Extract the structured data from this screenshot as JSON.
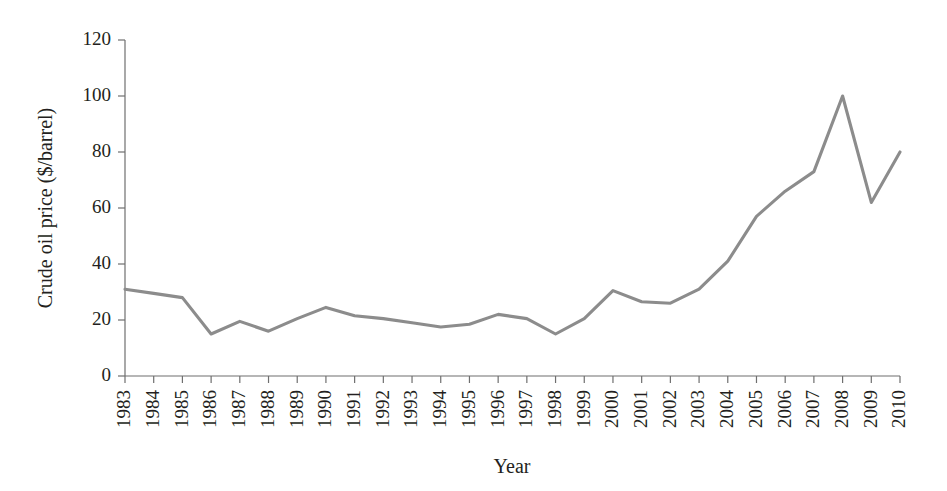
{
  "chart_data": {
    "type": "line",
    "title": "",
    "xlabel": "Year",
    "ylabel": "Crude oil price ($/barrel)",
    "categories": [
      "1983",
      "1984",
      "1985",
      "1986",
      "1987",
      "1988",
      "1989",
      "1990",
      "1991",
      "1992",
      "1993",
      "1994",
      "1995",
      "1996",
      "1997",
      "1998",
      "1999",
      "2000",
      "2001",
      "2002",
      "2003",
      "2004",
      "2005",
      "2006",
      "2007",
      "2008",
      "2009",
      "2010"
    ],
    "values": [
      31,
      29.5,
      28,
      15,
      19.5,
      16,
      20.5,
      24.5,
      21.5,
      20.5,
      19,
      17.5,
      18.5,
      22,
      20.5,
      15,
      20.5,
      30.5,
      26.5,
      26,
      31,
      41,
      57,
      66,
      73,
      100,
      62,
      80
    ],
    "series": [
      {
        "name": "Crude oil price",
        "color": "#8c8c8c",
        "values": [
          31,
          29.5,
          28,
          15,
          19.5,
          16,
          20.5,
          24.5,
          21.5,
          20.5,
          19,
          17.5,
          18.5,
          22,
          20.5,
          15,
          20.5,
          30.5,
          26.5,
          26,
          31,
          41,
          57,
          66,
          73,
          100,
          62,
          80
        ]
      }
    ],
    "yticks": [
      0,
      20,
      40,
      60,
      80,
      100,
      120
    ],
    "ylim": [
      0,
      120
    ],
    "xlim": [
      "1983",
      "2010"
    ],
    "grid": false,
    "legend": false,
    "xtick_rotation": 90
  }
}
